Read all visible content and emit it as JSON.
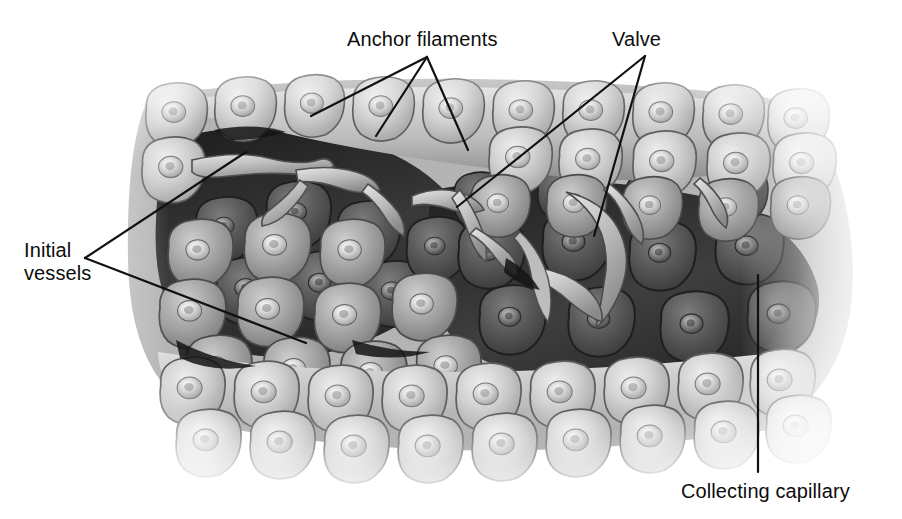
{
  "figure": {
    "width": 902,
    "height": 519,
    "background_color": "#ffffff",
    "render_style": "grayscale stippled medical illustration"
  },
  "labels": [
    {
      "id": "anchor-filaments",
      "text": "Anchor filaments",
      "x": 347,
      "y": 28,
      "lines": 1,
      "align": "left"
    },
    {
      "id": "valve",
      "text": "Valve",
      "x": 612,
      "y": 28,
      "lines": 1,
      "align": "left"
    },
    {
      "id": "initial-vessels",
      "text": "Initial\nvessels",
      "x": 24,
      "y": 239,
      "lines": 2,
      "align": "left"
    },
    {
      "id": "collecting-capillary",
      "text": "Collecting capillary",
      "x": 681,
      "y": 480,
      "lines": 1,
      "align": "left"
    }
  ],
  "leader_lines": [
    {
      "id": "anchor-filaments-leader-1",
      "from": [
        427,
        57
      ],
      "to": [
        311,
        116
      ]
    },
    {
      "id": "anchor-filaments-leader-2",
      "from": [
        427,
        57
      ],
      "to": [
        376,
        136
      ]
    },
    {
      "id": "anchor-filaments-leader-3",
      "from": [
        427,
        57
      ],
      "to": [
        468,
        150
      ]
    },
    {
      "id": "valve-leader-1",
      "from": [
        645,
        56
      ],
      "to": [
        457,
        207
      ]
    },
    {
      "id": "valve-leader-2",
      "from": [
        645,
        56
      ],
      "to": [
        594,
        236
      ]
    },
    {
      "id": "initial-vessels-leader-1",
      "from": [
        85,
        258
      ],
      "to": [
        246,
        152
      ]
    },
    {
      "id": "initial-vessels-leader-2",
      "from": [
        85,
        258
      ],
      "to": [
        306,
        343
      ]
    },
    {
      "id": "collecting-capillary-leader",
      "from": [
        758,
        275
      ],
      "to": [
        758,
        472
      ]
    }
  ],
  "style": {
    "leader_stroke": "#111111",
    "leader_width": 2.2,
    "text_color": "#0d0d0d",
    "font_size_px": 20
  },
  "anatomy": {
    "tissue_tone_light": "#c9c9c9",
    "tissue_tone_mid": "#8f8f8f",
    "tissue_tone_dark": "#3a3a3a",
    "lumen_tone": "#2a2a2a",
    "highlight_tone": "#e8e8e8",
    "regions": [
      {
        "name": "upper-epithelial-sheet",
        "tone": "light"
      },
      {
        "name": "initial-vessel-lumen-left",
        "tone": "dark"
      },
      {
        "name": "initial-vessel-lumen-right",
        "tone": "dark"
      },
      {
        "name": "collecting-capillary-wall",
        "tone": "mid"
      },
      {
        "name": "lower-epithelial-sheet",
        "tone": "light"
      }
    ]
  }
}
